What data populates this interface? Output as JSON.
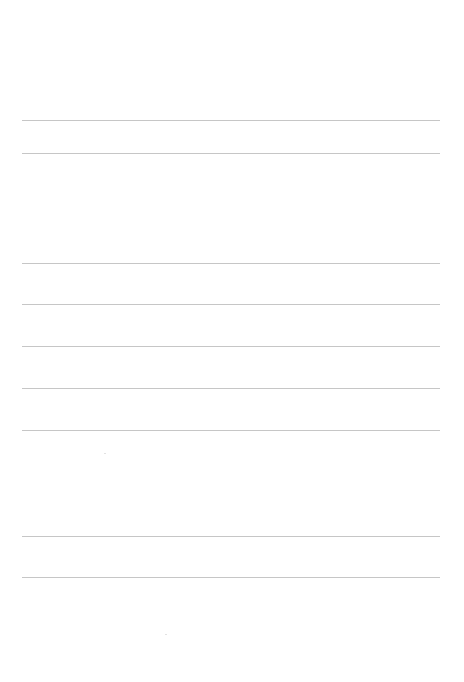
{
  "page": {
    "type": "blank lined paper",
    "background_color": "#ffffff",
    "line_color": "#c6c6c6",
    "lines_y": [
      120,
      153,
      263,
      304,
      346,
      388,
      430,
      536,
      577
    ],
    "line_x_start": 22,
    "line_x_end": 440,
    "text_content": []
  }
}
